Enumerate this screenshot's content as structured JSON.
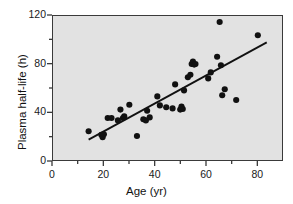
{
  "chart_data": {
    "type": "scatter",
    "title": "",
    "xlabel": "Age (yr)",
    "ylabel": "Plasma half-life (h)",
    "xlim": [
      0,
      90
    ],
    "ylim": [
      0,
      120
    ],
    "xticks": [
      0,
      20,
      40,
      60,
      80
    ],
    "xticklabels": [
      "0",
      "20",
      "40",
      "60",
      "80"
    ],
    "xminorticks": [
      10,
      30,
      50,
      70
    ],
    "yticks": [
      0,
      40,
      80,
      120
    ],
    "yticklabels": [
      "0",
      "40",
      "80",
      "120"
    ],
    "yminorticks": [
      20,
      60,
      100
    ],
    "grid": false,
    "legend": null,
    "plot_background": "#e2e2e2",
    "marker_color": "#111111",
    "marker_shape": "circle",
    "line_color": "#111111",
    "points": [
      {
        "x": 14.0,
        "y": 24.0
      },
      {
        "x": 19.0,
        "y": 21.0
      },
      {
        "x": 19.5,
        "y": 19.0
      },
      {
        "x": 20.0,
        "y": 21.5
      },
      {
        "x": 21.5,
        "y": 35.0
      },
      {
        "x": 23.0,
        "y": 35.0
      },
      {
        "x": 25.5,
        "y": 33.0
      },
      {
        "x": 26.5,
        "y": 42.0
      },
      {
        "x": 27.5,
        "y": 35.0
      },
      {
        "x": 28.0,
        "y": 36.5
      },
      {
        "x": 30.0,
        "y": 46.0
      },
      {
        "x": 33.0,
        "y": 20.0
      },
      {
        "x": 35.5,
        "y": 34.0
      },
      {
        "x": 36.5,
        "y": 33.0
      },
      {
        "x": 37.0,
        "y": 41.0
      },
      {
        "x": 38.0,
        "y": 35.5
      },
      {
        "x": 41.0,
        "y": 53.0
      },
      {
        "x": 42.0,
        "y": 45.5
      },
      {
        "x": 44.5,
        "y": 44.0
      },
      {
        "x": 47.0,
        "y": 43.0
      },
      {
        "x": 48.0,
        "y": 63.0
      },
      {
        "x": 50.0,
        "y": 42.0
      },
      {
        "x": 50.5,
        "y": 44.5
      },
      {
        "x": 51.0,
        "y": 42.5
      },
      {
        "x": 51.5,
        "y": 58.0
      },
      {
        "x": 53.0,
        "y": 69.0
      },
      {
        "x": 54.0,
        "y": 71.0
      },
      {
        "x": 54.5,
        "y": 80.0
      },
      {
        "x": 55.0,
        "y": 82.0
      },
      {
        "x": 55.5,
        "y": 79.5
      },
      {
        "x": 56.0,
        "y": 80.0
      },
      {
        "x": 61.0,
        "y": 68.0
      },
      {
        "x": 62.0,
        "y": 73.0
      },
      {
        "x": 64.5,
        "y": 86.0
      },
      {
        "x": 65.5,
        "y": 115.0
      },
      {
        "x": 66.0,
        "y": 79.0
      },
      {
        "x": 66.5,
        "y": 54.0
      },
      {
        "x": 67.5,
        "y": 59.0
      },
      {
        "x": 72.0,
        "y": 50.0
      },
      {
        "x": 80.5,
        "y": 104.0
      }
    ],
    "fit_line": {
      "type": "linear-regression",
      "x_start": 14.0,
      "y_start": 17.0,
      "x_end": 84.0,
      "y_end": 98.0
    }
  }
}
